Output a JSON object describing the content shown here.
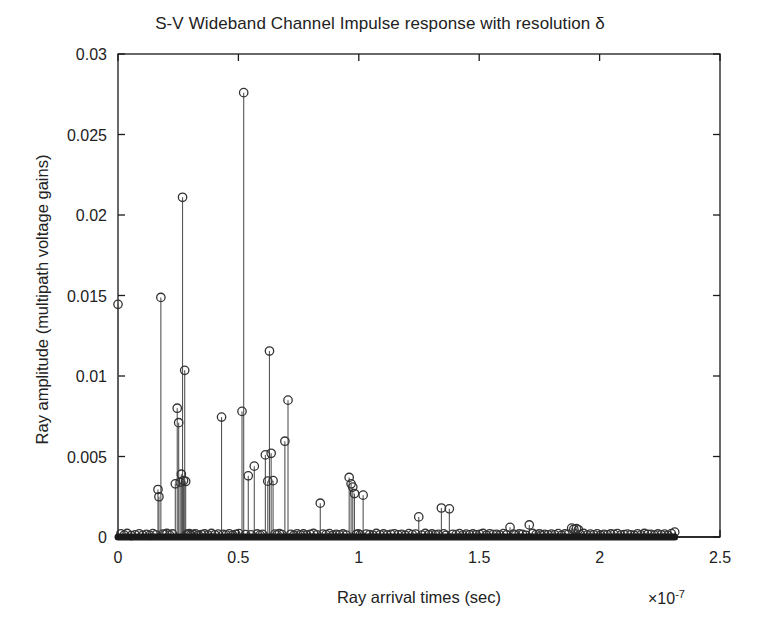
{
  "chart_data": {
    "type": "scatter",
    "plot_style": "stem",
    "title": "S-V Wideband Channel Impulse response with resolution δ",
    "xlabel": "Ray arrival times (sec)",
    "ylabel": "Ray amplitude (multipath voltage gains)",
    "x_exponent_label": "×10",
    "x_exponent_power": "-7",
    "x_scale_factor": 1e-07,
    "xlim": [
      0,
      2.5
    ],
    "ylim": [
      0,
      0.03
    ],
    "xticks": [
      0,
      0.5,
      1,
      1.5,
      2,
      2.5
    ],
    "xticklabels": [
      "0",
      "0.5",
      "1",
      "1.5",
      "2",
      "2.5"
    ],
    "yticks": [
      0,
      0.005,
      0.01,
      0.015,
      0.02,
      0.025,
      0.03
    ],
    "yticklabels": [
      "0",
      "0.005",
      "0.01",
      "0.015",
      "0.02",
      "0.025",
      "0.03"
    ],
    "grid": false,
    "legend": false,
    "marker": "circle-open",
    "marker_color": "#333333",
    "stem_color": "#555555",
    "baseline_color": "#1a1a1a",
    "x": [
      0.0,
      0.012,
      0.026,
      0.038,
      0.055,
      0.071,
      0.088,
      0.103,
      0.118,
      0.132,
      0.145,
      0.157,
      0.166,
      0.17,
      0.178,
      0.186,
      0.194,
      0.203,
      0.214,
      0.226,
      0.238,
      0.246,
      0.252,
      0.258,
      0.263,
      0.268,
      0.272,
      0.277,
      0.281,
      0.286,
      0.291,
      0.296,
      0.303,
      0.312,
      0.322,
      0.334,
      0.347,
      0.36,
      0.374,
      0.388,
      0.402,
      0.416,
      0.43,
      0.437,
      0.449,
      0.462,
      0.476,
      0.489,
      0.502,
      0.515,
      0.522,
      0.53,
      0.541,
      0.553,
      0.566,
      0.578,
      0.59,
      0.601,
      0.612,
      0.622,
      0.629,
      0.636,
      0.644,
      0.652,
      0.661,
      0.67,
      0.681,
      0.693,
      0.706,
      0.718,
      0.731,
      0.744,
      0.757,
      0.77,
      0.784,
      0.798,
      0.812,
      0.826,
      0.84,
      0.851,
      0.864,
      0.878,
      0.892,
      0.906,
      0.92,
      0.934,
      0.948,
      0.96,
      0.968,
      0.975,
      0.982,
      0.99,
      0.998,
      1.006,
      1.018,
      1.031,
      1.045,
      1.059,
      1.073,
      1.088,
      1.103,
      1.118,
      1.133,
      1.148,
      1.163,
      1.178,
      1.193,
      1.208,
      1.222,
      1.236,
      1.249,
      1.262,
      1.276,
      1.29,
      1.304,
      1.318,
      1.33,
      1.343,
      1.352,
      1.362,
      1.376,
      1.39,
      1.404,
      1.418,
      1.432,
      1.446,
      1.46,
      1.474,
      1.488,
      1.502,
      1.516,
      1.53,
      1.544,
      1.558,
      1.572,
      1.586,
      1.6,
      1.614,
      1.628,
      1.642,
      1.651,
      1.666,
      1.68,
      1.694,
      1.708,
      1.722,
      1.736,
      1.75,
      1.758,
      1.772,
      1.786,
      1.8,
      1.814,
      1.828,
      1.842,
      1.856,
      1.87,
      1.884,
      1.893,
      1.904,
      1.912,
      1.92,
      1.934,
      1.948,
      1.962,
      1.976,
      1.99,
      2.004,
      2.018,
      2.032,
      2.046,
      2.06,
      2.074,
      2.088,
      2.102,
      2.116,
      2.13,
      2.144,
      2.158,
      2.172,
      2.186,
      2.2,
      2.214,
      2.228,
      2.242,
      2.256,
      2.27,
      2.284,
      2.298,
      2.312
    ],
    "y": [
      0.01445,
      0.0002,
      0.00012,
      0.00022,
      9e-05,
      0.00014,
      0.0002,
      0.00011,
      0.00016,
      0.0001,
      0.00021,
      0.00013,
      0.00295,
      0.0025,
      0.01488,
      0.00018,
      0.00015,
      0.00022,
      0.00012,
      0.00019,
      0.0033,
      0.008,
      0.0071,
      0.0034,
      0.0039,
      0.0211,
      0.0035,
      0.01035,
      0.00345,
      0.00018,
      0.00014,
      0.00021,
      0.00013,
      0.00017,
      0.0002,
      0.00011,
      0.00015,
      0.00019,
      0.00012,
      0.00022,
      0.00014,
      0.00018,
      0.00745,
      0.00016,
      0.00013,
      0.0002,
      0.00011,
      0.00017,
      0.00021,
      0.0078,
      0.0276,
      0.00015,
      0.0038,
      0.00014,
      0.0044,
      0.00019,
      0.00012,
      0.00016,
      0.0051,
      0.00347,
      0.01155,
      0.0052,
      0.0035,
      0.00018,
      0.00013,
      0.00021,
      0.00015,
      0.00595,
      0.0085,
      0.00017,
      0.00011,
      0.0002,
      0.00014,
      0.00019,
      0.00012,
      0.00016,
      0.00022,
      0.00013,
      0.0021,
      0.00018,
      0.00015,
      0.00021,
      0.00011,
      0.00017,
      0.00014,
      0.00019,
      0.00012,
      0.0037,
      0.0033,
      0.0031,
      0.0027,
      0.00016,
      0.0002,
      0.00013,
      0.0026,
      0.00018,
      0.00015,
      0.00011,
      0.00022,
      0.00014,
      0.00019,
      0.00012,
      0.00017,
      0.0002,
      0.00013,
      0.00016,
      0.00011,
      0.00021,
      0.00015,
      0.00018,
      0.00125,
      0.00012,
      0.00022,
      0.00014,
      0.00019,
      0.00013,
      0.00016,
      0.0018,
      0.0002,
      0.00011,
      0.00175,
      0.00017,
      0.00015,
      0.00021,
      0.00012,
      0.00018,
      0.00014,
      0.00019,
      0.00013,
      0.00016,
      0.00022,
      0.00011,
      0.0002,
      0.00015,
      0.00017,
      0.00012,
      0.00021,
      0.00014,
      0.0006,
      0.00018,
      0.00013,
      0.00019,
      0.00016,
      0.00011,
      0.00075,
      0.00022,
      0.00015,
      0.0002,
      0.00012,
      0.00017,
      0.00014,
      0.00018,
      0.00013,
      0.00021,
      0.00011,
      0.00019,
      0.00016,
      0.00055,
      0.00048,
      0.00052,
      0.00045,
      0.00015,
      0.00022,
      0.00012,
      0.00018,
      0.00014,
      0.0002,
      0.00011,
      0.00017,
      0.00013,
      0.00019,
      0.00016,
      0.00021,
      0.00012,
      0.00015,
      0.00018,
      0.00014,
      0.00011,
      0.0002,
      0.00013,
      0.00022,
      0.00017,
      0.00016,
      0.00012,
      0.00019,
      0.00014,
      0.00018,
      0.00011,
      0.00021,
      0.0003
    ],
    "annotations": [
      {
        "label": "peak-max",
        "x": 0.522,
        "y": 0.0276
      },
      {
        "label": "peak-second",
        "x": 0.268,
        "y": 0.0211
      },
      {
        "label": "peak-third",
        "x": 0.178,
        "y": 0.01488
      },
      {
        "label": "peak-first",
        "x": 0.0,
        "y": 0.01445
      }
    ]
  }
}
